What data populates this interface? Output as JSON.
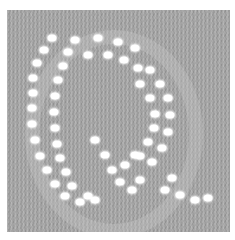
{
  "image": {
    "subject": "knitted fabric swatch with eyelet lace forming the letter Q",
    "letter": "Q",
    "colors": {
      "background": "#ffffff",
      "fabric": "#a9a9a9",
      "eyelet": "#ffffff"
    },
    "fabric_bounds": {
      "x": 7,
      "y": 10,
      "width": 223,
      "height": 222
    }
  },
  "eyelets": [
    {
      "x": 52,
      "y": 38
    },
    {
      "x": 44,
      "y": 50
    },
    {
      "x": 37,
      "y": 63
    },
    {
      "x": 33,
      "y": 78
    },
    {
      "x": 33,
      "y": 93
    },
    {
      "x": 32,
      "y": 108
    },
    {
      "x": 32,
      "y": 124
    },
    {
      "x": 35,
      "y": 140
    },
    {
      "x": 40,
      "y": 156
    },
    {
      "x": 47,
      "y": 170
    },
    {
      "x": 55,
      "y": 184
    },
    {
      "x": 65,
      "y": 196
    },
    {
      "x": 80,
      "y": 202
    },
    {
      "x": 95,
      "y": 200
    },
    {
      "x": 68,
      "y": 52
    },
    {
      "x": 63,
      "y": 66
    },
    {
      "x": 58,
      "y": 80
    },
    {
      "x": 55,
      "y": 96
    },
    {
      "x": 54,
      "y": 112
    },
    {
      "x": 55,
      "y": 128
    },
    {
      "x": 57,
      "y": 144
    },
    {
      "x": 60,
      "y": 158
    },
    {
      "x": 66,
      "y": 172
    },
    {
      "x": 72,
      "y": 186
    },
    {
      "x": 88,
      "y": 196
    },
    {
      "x": 75,
      "y": 40
    },
    {
      "x": 98,
      "y": 38
    },
    {
      "x": 118,
      "y": 42
    },
    {
      "x": 135,
      "y": 48
    },
    {
      "x": 88,
      "y": 55
    },
    {
      "x": 108,
      "y": 55
    },
    {
      "x": 124,
      "y": 60
    },
    {
      "x": 138,
      "y": 68
    },
    {
      "x": 150,
      "y": 70
    },
    {
      "x": 160,
      "y": 84
    },
    {
      "x": 168,
      "y": 98
    },
    {
      "x": 170,
      "y": 115
    },
    {
      "x": 168,
      "y": 132
    },
    {
      "x": 162,
      "y": 148
    },
    {
      "x": 152,
      "y": 162
    },
    {
      "x": 140,
      "y": 84
    },
    {
      "x": 150,
      "y": 98
    },
    {
      "x": 155,
      "y": 114
    },
    {
      "x": 154,
      "y": 128
    },
    {
      "x": 148,
      "y": 142
    },
    {
      "x": 140,
      "y": 156
    },
    {
      "x": 95,
      "y": 140
    },
    {
      "x": 105,
      "y": 155
    },
    {
      "x": 112,
      "y": 170
    },
    {
      "x": 120,
      "y": 182
    },
    {
      "x": 132,
      "y": 190
    },
    {
      "x": 140,
      "y": 180
    },
    {
      "x": 125,
      "y": 165
    },
    {
      "x": 135,
      "y": 155
    },
    {
      "x": 165,
      "y": 190
    },
    {
      "x": 180,
      "y": 195
    },
    {
      "x": 195,
      "y": 200
    },
    {
      "x": 208,
      "y": 198
    },
    {
      "x": 172,
      "y": 178
    }
  ]
}
